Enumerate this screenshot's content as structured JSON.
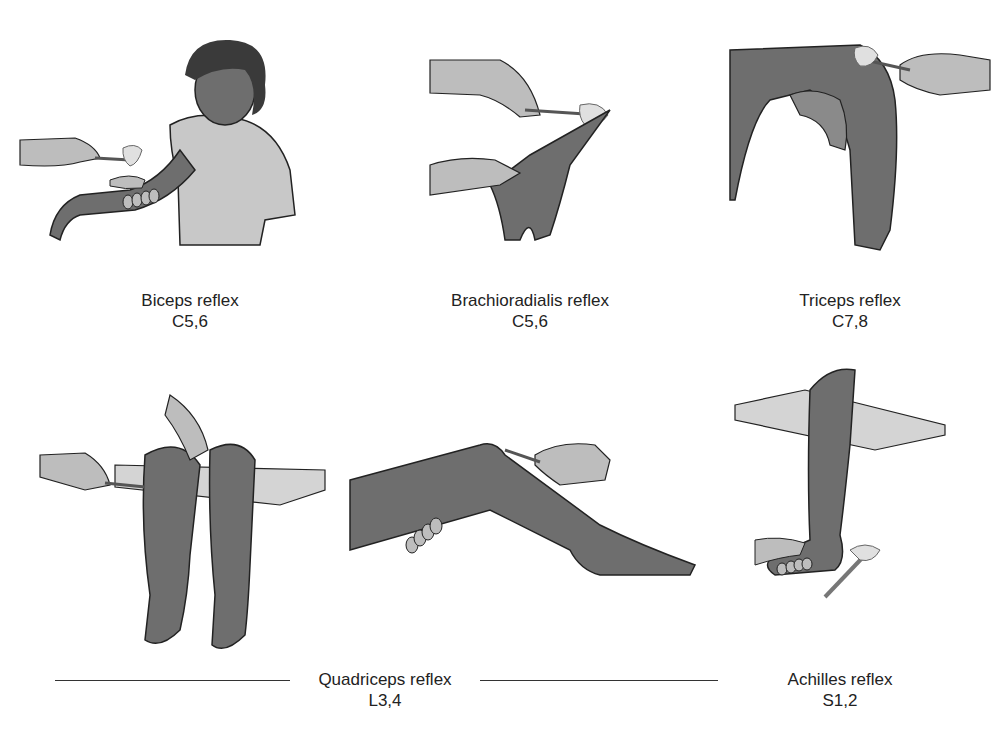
{
  "figure": {
    "panels": [
      {
        "id": "biceps",
        "label": "Biceps reflex",
        "roots": "C5,6",
        "illustration": "child-seated-forearm-tapped-with-reflex-hammer"
      },
      {
        "id": "brachioradialis",
        "label": "Brachioradialis reflex",
        "roots": "C5,6",
        "illustration": "wrist-tapped-with-reflex-hammer"
      },
      {
        "id": "triceps",
        "label": "Triceps reflex",
        "roots": "C7,8",
        "illustration": "flexed-arm-tapped-above-elbow"
      },
      {
        "id": "quadriceps",
        "label": "Quadriceps reflex",
        "roots": "L3,4",
        "illustration": "seated-knee-and-supine-knee-tapped"
      },
      {
        "id": "achilles",
        "label": "Achilles reflex",
        "roots": "S1,2",
        "illustration": "dangling-leg-foot-dorsiflexed-heel-tapped"
      }
    ]
  },
  "colors": {
    "skin": "#6e6e6e",
    "skin_light": "#bdbdbd",
    "shirt": "#c8c8c8",
    "hair": "#3a3a3a",
    "table": "#d4d4d4",
    "outline": "#222222",
    "text": "#222222"
  }
}
